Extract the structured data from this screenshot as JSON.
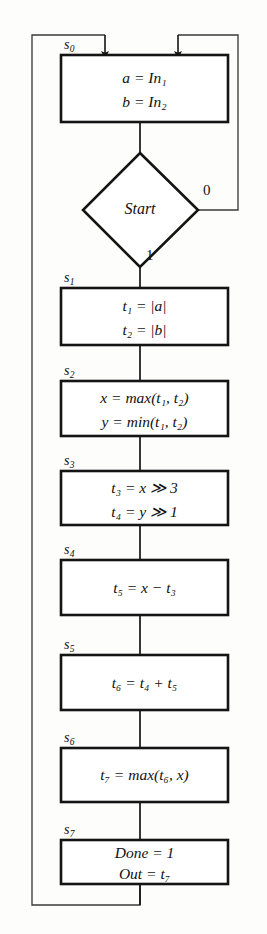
{
  "diagram": {
    "type": "flowchart",
    "colors": {
      "stroke": "#141414",
      "background": "#fdfdfc",
      "text": "#111111",
      "thin_stroke": "#3a3a3a"
    },
    "decision": {
      "state_label": "",
      "label": "Start",
      "branch_true": "1",
      "branch_false": "0"
    },
    "nodes": [
      {
        "state": "s",
        "state_sub": "0",
        "lines": [
          "a = In₁",
          "b = In₂"
        ],
        "line_parts": [
          {
            "lhs": "a",
            "lhs_sub": "",
            "op": "=",
            "rhs": "In",
            "rhs_sub": "1"
          },
          {
            "lhs": "b",
            "lhs_sub": "",
            "op": "=",
            "rhs": "In",
            "rhs_sub": "2"
          }
        ]
      },
      {
        "state": "s",
        "state_sub": "1",
        "lines": [
          "t₁ = |a|",
          "t₂ = |b|"
        ],
        "line_parts": [
          {
            "lhs": "t",
            "lhs_sub": "1",
            "op": "=",
            "rhs": "|a|",
            "rhs_sub": ""
          },
          {
            "lhs": "t",
            "lhs_sub": "2",
            "op": "=",
            "rhs": "|b|",
            "rhs_sub": ""
          }
        ]
      },
      {
        "state": "s",
        "state_sub": "2",
        "lines": [
          "x = max(t₁, t₂)",
          "y = min(t₁, t₂)"
        ],
        "line_parts": [
          {
            "lhs": "x",
            "lhs_sub": "",
            "op": "=",
            "rhs": "max(t₁, t₂)",
            "rhs_sub": ""
          },
          {
            "lhs": "y",
            "lhs_sub": "",
            "op": "=",
            "rhs": "min(t₁, t₂)",
            "rhs_sub": ""
          }
        ]
      },
      {
        "state": "s",
        "state_sub": "3",
        "lines": [
          "t₃ = x ≫ 3",
          "t₄ = y ≫ 1"
        ],
        "line_parts": [
          {
            "lhs": "t",
            "lhs_sub": "3",
            "op": "=",
            "rhs": "x ≫ 3",
            "rhs_sub": ""
          },
          {
            "lhs": "t",
            "lhs_sub": "4",
            "op": "=",
            "rhs": "y ≫ 1",
            "rhs_sub": ""
          }
        ]
      },
      {
        "state": "s",
        "state_sub": "4",
        "lines": [
          "t₅ = x − t₃"
        ],
        "line_parts": [
          {
            "lhs": "t",
            "lhs_sub": "5",
            "op": "=",
            "rhs": "x − t₃",
            "rhs_sub": ""
          }
        ]
      },
      {
        "state": "s",
        "state_sub": "5",
        "lines": [
          "t₆ = t₄ + t₅"
        ],
        "line_parts": [
          {
            "lhs": "t",
            "lhs_sub": "6",
            "op": "=",
            "rhs": "t₄ + t₅",
            "rhs_sub": ""
          }
        ]
      },
      {
        "state": "s",
        "state_sub": "6",
        "lines": [
          "t₇ = max(t₆, x)"
        ],
        "line_parts": [
          {
            "lhs": "t",
            "lhs_sub": "7",
            "op": "=",
            "rhs": "max(t₆, x)",
            "rhs_sub": ""
          }
        ]
      },
      {
        "state": "s",
        "state_sub": "7",
        "lines": [
          "Done = 1",
          "Out = t₇"
        ],
        "line_parts": [
          {
            "lhs": "Done",
            "lhs_sub": "",
            "op": "=",
            "rhs": "1",
            "rhs_sub": ""
          },
          {
            "lhs": "Out",
            "lhs_sub": "",
            "op": "=",
            "rhs": "t₇",
            "rhs_sub": ""
          }
        ]
      }
    ]
  }
}
